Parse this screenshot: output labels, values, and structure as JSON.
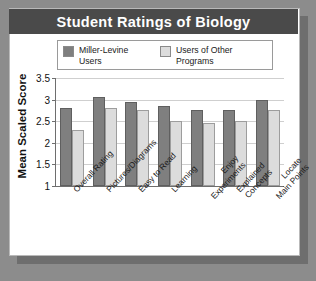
{
  "card": {
    "title": "Student Ratings of Biology"
  },
  "legend": {
    "position": "top-inside",
    "entries": [
      {
        "label": "Miller-Levine Users",
        "color": "#7f7f7f",
        "swatch": "dark-swatch"
      },
      {
        "label": "Users of Other Programs",
        "color": "#dcdcdc",
        "swatch": "light-swatch"
      }
    ]
  },
  "chart_data": {
    "type": "bar",
    "title": "Student Ratings of Biology",
    "xlabel": "",
    "ylabel": "Mean Scaled Score",
    "ylim": [
      1,
      3.5
    ],
    "yticks": [
      "3.5",
      "3",
      "2.5",
      "2",
      "1.5",
      "1"
    ],
    "ytick_values": [
      3.5,
      3,
      2.5,
      2,
      1.5,
      1
    ],
    "grid": true,
    "categories": [
      "Overall Rating",
      "Pictures/Diagrams",
      "Easy to Read",
      "Learning",
      "Enjoy Experiments",
      "Explained Concepts",
      "Locate Main Points"
    ],
    "category_lines": [
      [
        "Overall Rating"
      ],
      [
        "Pictures/Diagrams"
      ],
      [
        "Easy to Read"
      ],
      [
        "Learning"
      ],
      [
        "Enjoy",
        "Experiments"
      ],
      [
        "Explained",
        "Concepts"
      ],
      [
        "Locate",
        "Main Points"
      ]
    ],
    "series": [
      {
        "name": "Miller-Levine Users",
        "color": "#7f7f7f",
        "values": [
          2.8,
          3.05,
          2.95,
          2.85,
          2.75,
          2.75,
          3.0
        ]
      },
      {
        "name": "Users of Other Programs",
        "color": "#dcdcdc",
        "values": [
          2.3,
          2.8,
          2.75,
          2.5,
          2.45,
          2.5,
          2.75
        ]
      }
    ]
  },
  "colors": {
    "page_background": "#8c8c8c",
    "card_background": "#ffffff",
    "title_bar": "#4a4a4a",
    "title_text": "#ffffff",
    "axis": "#6e6e6e",
    "gridline": "#cfcfcf"
  }
}
